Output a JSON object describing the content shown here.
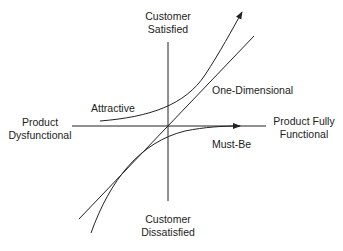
{
  "diagram": {
    "axes": {
      "y_top": [
        "Customer",
        "Satisfied"
      ],
      "y_bottom": [
        "Customer",
        "Dissatisfied"
      ],
      "x_left": [
        "Product",
        "Dysfunctional"
      ],
      "x_right": [
        "Product Fully",
        "Functional"
      ]
    },
    "curves": {
      "attractive": "Attractive",
      "one_dimensional": "One-Dimensional",
      "must_be": "Must-Be"
    },
    "colors": {
      "line": "#222222",
      "background": "#ffffff"
    }
  }
}
